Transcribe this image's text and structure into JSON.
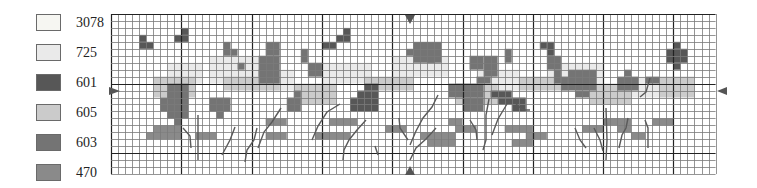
{
  "legend": [
    {
      "code": "3078",
      "color": "#f6f6f2"
    },
    {
      "code": "725",
      "color": "#eaeaea"
    },
    {
      "code": "601",
      "color": "#575757"
    },
    {
      "code": "605",
      "color": "#cbcbcb"
    },
    {
      "code": "603",
      "color": "#747474"
    },
    {
      "code": "470",
      "color": "#8a8a8a"
    }
  ],
  "grid": {
    "left": 111,
    "top": 14,
    "cols": 86,
    "rows": 23,
    "cell_w": 7.03,
    "cell_h": 6.96,
    "major_every": 10,
    "major_offset": 0,
    "minor_color": "#7a7a7a",
    "major_color": "#222222"
  },
  "center_markers": {
    "top": {
      "x": 410,
      "y": 15,
      "symbol": "triangle-down"
    },
    "bottom": {
      "x": 410,
      "y": 170,
      "symbol": "triangle-up"
    },
    "left": {
      "x": 111,
      "y": 91,
      "symbol": "triangle-right"
    },
    "right": {
      "x": 715,
      "y": 91,
      "symbol": "triangle-left"
    }
  },
  "blocks": [
    {
      "code": "725",
      "cells": [
        [
          8,
          7,
          5,
          3
        ],
        [
          14,
          6,
          8,
          4
        ],
        [
          20,
          8,
          6,
          3
        ],
        [
          30,
          7,
          7,
          3
        ],
        [
          40,
          6,
          8,
          3
        ],
        [
          52,
          8,
          6,
          3
        ],
        [
          62,
          7,
          8,
          3
        ],
        [
          72,
          9,
          6,
          3
        ]
      ]
    },
    {
      "code": "605",
      "cells": [
        [
          6,
          9,
          6,
          3
        ],
        [
          16,
          9,
          8,
          2
        ],
        [
          26,
          10,
          6,
          3
        ],
        [
          36,
          9,
          7,
          2
        ],
        [
          49,
          10,
          6,
          3
        ],
        [
          58,
          9,
          7,
          2
        ],
        [
          68,
          10,
          6,
          3
        ],
        [
          78,
          9,
          5,
          3
        ]
      ]
    },
    {
      "code": "601",
      "cells": [
        [
          4,
          3,
          1,
          1
        ],
        [
          4,
          4,
          2,
          1
        ],
        [
          9,
          3,
          2,
          1
        ],
        [
          10,
          2,
          1,
          1
        ],
        [
          30,
          4,
          2,
          1
        ],
        [
          32,
          3,
          2,
          1
        ],
        [
          33,
          2,
          1,
          1
        ],
        [
          36,
          10,
          2,
          1
        ],
        [
          35,
          11,
          3,
          3
        ],
        [
          34,
          12,
          1,
          2
        ],
        [
          54,
          11,
          3,
          1
        ],
        [
          55,
          12,
          4,
          1
        ],
        [
          57,
          13,
          2,
          1
        ],
        [
          80,
          4,
          1,
          1
        ],
        [
          79,
          5,
          3,
          2
        ],
        [
          80,
          7,
          1,
          1
        ],
        [
          61,
          4,
          1,
          1
        ],
        [
          62,
          4,
          1,
          2
        ]
      ]
    },
    {
      "code": "603",
      "cells": [
        [
          8,
          10,
          3,
          5
        ],
        [
          7,
          12,
          1,
          2
        ],
        [
          9,
          15,
          1,
          1
        ],
        [
          14,
          12,
          3,
          2
        ],
        [
          15,
          14,
          1,
          1
        ],
        [
          21,
          6,
          3,
          4
        ],
        [
          22,
          4,
          2,
          2
        ],
        [
          16,
          4,
          1,
          2
        ],
        [
          17,
          5,
          1,
          1
        ],
        [
          25,
          12,
          2,
          2
        ],
        [
          26,
          11,
          1,
          1
        ],
        [
          21,
          8,
          1,
          1
        ],
        [
          18,
          7,
          1,
          1
        ],
        [
          28,
          7,
          2,
          2
        ],
        [
          27,
          5,
          1,
          2
        ],
        [
          43,
          4,
          4,
          3
        ],
        [
          42,
          5,
          1,
          1
        ],
        [
          45,
          6,
          1,
          1
        ],
        [
          48,
          10,
          5,
          2
        ],
        [
          52,
          9,
          2,
          1
        ],
        [
          50,
          12,
          3,
          2
        ],
        [
          51,
          6,
          2,
          2
        ],
        [
          53,
          6,
          2,
          3
        ],
        [
          56,
          5,
          1,
          2
        ],
        [
          65,
          8,
          4,
          3
        ],
        [
          64,
          9,
          1,
          2
        ],
        [
          66,
          11,
          2,
          1
        ],
        [
          72,
          9,
          3,
          2
        ],
        [
          73,
          8,
          1,
          1
        ],
        [
          76,
          9,
          2,
          1
        ],
        [
          62,
          6,
          2,
          2
        ],
        [
          63,
          8,
          1,
          2
        ]
      ]
    },
    {
      "code": "470",
      "cells": [
        [
          6,
          16,
          4,
          1
        ],
        [
          5,
          17,
          5,
          1
        ],
        [
          22,
          15,
          3,
          1
        ],
        [
          22,
          17,
          3,
          1
        ],
        [
          29,
          17,
          5,
          1
        ],
        [
          31,
          15,
          4,
          1
        ],
        [
          39,
          16,
          3,
          1
        ],
        [
          44,
          17,
          5,
          1
        ],
        [
          49,
          16,
          3,
          1
        ],
        [
          56,
          16,
          4,
          1
        ],
        [
          57,
          18,
          3,
          1
        ],
        [
          59,
          17,
          3,
          1
        ],
        [
          67,
          16,
          3,
          1
        ],
        [
          70,
          15,
          4,
          1
        ],
        [
          72,
          16,
          2,
          1
        ],
        [
          74,
          17,
          2,
          1
        ],
        [
          45,
          18,
          4,
          1
        ],
        [
          12,
          17,
          3,
          1
        ],
        [
          48,
          15,
          2,
          1
        ],
        [
          77,
          15,
          3,
          1
        ]
      ]
    }
  ],
  "stems": [
    [
      [
        375,
        146
      ],
      [
        378,
        155
      ]
    ],
    [
      [
        198,
        115
      ],
      [
        198,
        160
      ]
    ],
    [
      [
        183,
        128
      ],
      [
        190,
        136
      ],
      [
        191,
        148
      ]
    ],
    [
      [
        235,
        127
      ],
      [
        230,
        140
      ],
      [
        222,
        155
      ]
    ],
    [
      [
        257,
        128
      ],
      [
        254,
        140
      ],
      [
        247,
        150
      ],
      [
        245,
        162
      ]
    ],
    [
      [
        281,
        108
      ],
      [
        272,
        122
      ],
      [
        264,
        132
      ],
      [
        258,
        148
      ]
    ],
    [
      [
        340,
        104
      ],
      [
        327,
        112
      ],
      [
        318,
        126
      ],
      [
        312,
        140
      ]
    ],
    [
      [
        366,
        120
      ],
      [
        357,
        130
      ],
      [
        349,
        140
      ],
      [
        344,
        150
      ],
      [
        343,
        160
      ]
    ],
    [
      [
        408,
        140
      ],
      [
        400,
        128
      ],
      [
        399,
        118
      ]
    ],
    [
      [
        410,
        145
      ],
      [
        416,
        131
      ],
      [
        423,
        118
      ],
      [
        432,
        107
      ],
      [
        438,
        95
      ]
    ],
    [
      [
        410,
        160
      ],
      [
        416,
        148
      ],
      [
        426,
        139
      ],
      [
        436,
        128
      ]
    ],
    [
      [
        470,
        120
      ],
      [
        476,
        130
      ],
      [
        477,
        140
      ]
    ],
    [
      [
        489,
        99
      ],
      [
        486,
        115
      ],
      [
        486,
        140
      ],
      [
        483,
        150
      ]
    ],
    [
      [
        492,
        135
      ],
      [
        498,
        119
      ],
      [
        507,
        104
      ]
    ],
    [
      [
        575,
        128
      ],
      [
        580,
        140
      ],
      [
        586,
        148
      ]
    ],
    [
      [
        594,
        128
      ],
      [
        600,
        140
      ],
      [
        603,
        151
      ]
    ],
    [
      [
        606,
        108
      ],
      [
        607,
        140
      ],
      [
        606,
        160
      ]
    ],
    [
      [
        628,
        118
      ],
      [
        626,
        128
      ],
      [
        622,
        135
      ],
      [
        619,
        148
      ]
    ],
    [
      [
        645,
        120
      ],
      [
        648,
        128
      ],
      [
        648,
        148
      ]
    ],
    [
      [
        650,
        78
      ],
      [
        646,
        92
      ],
      [
        640,
        97
      ]
    ],
    [
      [
        516,
        104
      ],
      [
        523,
        110
      ],
      [
        530,
        110
      ]
    ]
  ]
}
